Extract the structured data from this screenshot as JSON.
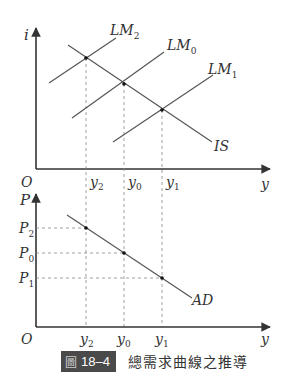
{
  "top_panel": {
    "y_axis_label": "i",
    "x_axis_label": "y",
    "origin_label": "O",
    "curves": {
      "lm2": "LM2",
      "lm0": "LM0",
      "lm1": "LM1",
      "is": "IS"
    },
    "x_ticks": [
      "y2",
      "y0",
      "y1"
    ]
  },
  "bottom_panel": {
    "y_axis_label": "P",
    "x_axis_label": "y",
    "origin_label": "O",
    "y_ticks": [
      "P2",
      "P0",
      "P1"
    ],
    "x_ticks": [
      "y2",
      "y0",
      "y1"
    ],
    "curve": "AD"
  },
  "caption": {
    "figure_label": "圖",
    "figure_number": "18–4",
    "title": "總需求曲線之推導"
  },
  "colors": {
    "line": "#555555",
    "axis": "#333333",
    "dash": "#888888",
    "badge": "#4a4a4a"
  }
}
